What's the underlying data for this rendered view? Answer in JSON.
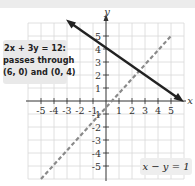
{
  "figure": {
    "axes": {
      "x_label": "x",
      "y_label": "y",
      "x_ticks": [
        "-5",
        "-4",
        "-3",
        "-2",
        "-1",
        "1",
        "2",
        "3",
        "4",
        "5"
      ],
      "y_ticks": [
        "5",
        "4",
        "3",
        "2",
        "1",
        "-1",
        "-2",
        "-3",
        "-4",
        "-5"
      ],
      "range_x": [
        -6,
        6
      ],
      "range_y": [
        -6,
        6
      ],
      "grid": true
    },
    "callout": {
      "line1": "2x + 3y = 12:",
      "line2": "passes through",
      "line3": "(6, 0) and (0, 4)"
    },
    "dashed_label": "x − y = 1",
    "lines": [
      {
        "equation": "2x + 3y = 12",
        "style": "solid",
        "color": "#222222",
        "points": [
          [
            6,
            0
          ],
          [
            0,
            4
          ],
          [
            -3,
            6
          ]
        ]
      },
      {
        "equation": "x − y = 1",
        "style": "dashed",
        "color": "#8a8a8a",
        "points": [
          [
            -5,
            -6
          ],
          [
            5,
            4
          ]
        ]
      }
    ]
  }
}
